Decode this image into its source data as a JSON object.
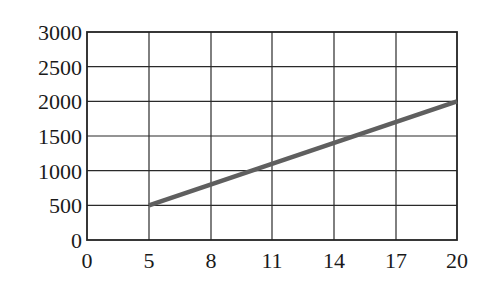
{
  "chart_data": {
    "type": "line",
    "title": "",
    "xlabel": "",
    "ylabel": "",
    "x_ticks": [
      0,
      5,
      8,
      11,
      14,
      17,
      20
    ],
    "y_ticks": [
      0,
      500,
      1000,
      1500,
      2000,
      2500,
      3000
    ],
    "xlim": [
      0,
      20
    ],
    "ylim": [
      0,
      3000
    ],
    "grid": true,
    "legend": null,
    "series": [
      {
        "name": "line",
        "color": "#5f5f5f",
        "x": [
          5,
          20
        ],
        "y": [
          500,
          2000
        ]
      }
    ]
  },
  "layout": {
    "plot_left": 87,
    "plot_top": 32,
    "plot_right": 457,
    "plot_bottom": 240,
    "x_grid_px": [
      87,
      149,
      211,
      272,
      334,
      396,
      457
    ]
  }
}
